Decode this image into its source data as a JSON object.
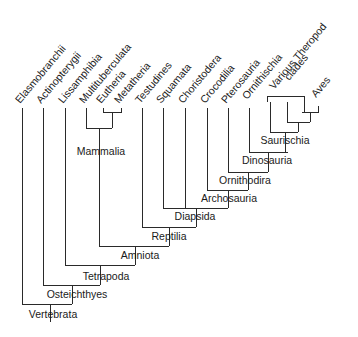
{
  "diagram": {
    "type": "cladogram",
    "line_color": "#2a2a2a",
    "text_color": "#1a1a1a",
    "background": "#ffffff",
    "leaves": [
      {
        "label": "Elasmobranchii",
        "x": 22
      },
      {
        "label": "Actinopterygii",
        "x": 43
      },
      {
        "label": "Lissamphibia",
        "x": 65
      },
      {
        "label": "Multituberculata",
        "x": 86
      },
      {
        "label": "Eutheria",
        "x": 103
      },
      {
        "label": "Metatheria",
        "x": 121
      },
      {
        "label": "Testudines",
        "x": 142
      },
      {
        "label": "Squamata",
        "x": 163
      },
      {
        "label": "Choristodera",
        "x": 185
      },
      {
        "label": "Crocodilia",
        "x": 207
      },
      {
        "label": "Pterosauria",
        "x": 228
      },
      {
        "label": "Ornithischia",
        "x": 249
      },
      {
        "label": "Various Theropod",
        "label2": "clades",
        "x": 286
      },
      {
        "label": "Aves",
        "x": 318
      }
    ],
    "clades": [
      {
        "label": "Mammalia",
        "x": 99,
        "y": 142
      },
      {
        "label": "Saurischia",
        "x": 285,
        "y": 143
      },
      {
        "label": "Dinosauria",
        "x": 268,
        "y": 163
      },
      {
        "label": "Ornithodira",
        "x": 248,
        "y": 184
      },
      {
        "label": "Archosauria",
        "x": 228,
        "y": 202
      },
      {
        "label": "Diapsida",
        "x": 196,
        "y": 220
      },
      {
        "label": "Reptilia",
        "x": 169,
        "y": 239
      },
      {
        "label": "Amniota",
        "x": 135,
        "y": 258
      },
      {
        "label": "Tetrapoda",
        "x": 100,
        "y": 277
      },
      {
        "label": "Osteichthyes",
        "x": 72,
        "y": 297
      },
      {
        "label": "Vertebrata",
        "x": 50,
        "y": 316
      }
    ]
  }
}
